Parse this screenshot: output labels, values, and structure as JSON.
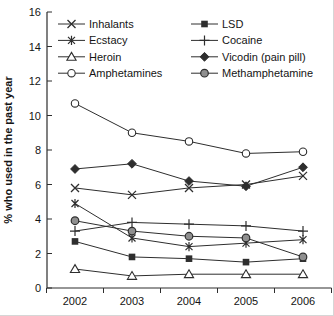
{
  "chart_data": {
    "type": "line",
    "title": "",
    "xlabel": "",
    "ylabel": "% who used in the past year",
    "categories": [
      "2002",
      "2003",
      "2004",
      "2005",
      "2006"
    ],
    "ylim": [
      0,
      16
    ],
    "yticks": [
      0,
      2,
      4,
      6,
      8,
      10,
      12,
      14,
      16
    ],
    "grid": false,
    "legend_position": "top-inside-two-columns-no-border",
    "line_color": "#2e2e2e",
    "marker_gray_fill": "#8f8f8f",
    "series": [
      {
        "name": "Inhalants",
        "marker": "x",
        "values": [
          5.8,
          5.4,
          5.8,
          6.0,
          6.5
        ]
      },
      {
        "name": "Ecstacy",
        "marker": "asterisk",
        "values": [
          4.9,
          2.9,
          2.4,
          2.6,
          2.8
        ]
      },
      {
        "name": "Heroin",
        "marker": "triangle-open",
        "values": [
          1.1,
          0.7,
          0.8,
          0.8,
          0.8
        ]
      },
      {
        "name": "Amphetamines",
        "marker": "circle-open",
        "values": [
          10.7,
          9.0,
          8.5,
          7.8,
          7.9
        ]
      },
      {
        "name": "LSD",
        "marker": "square-filled",
        "values": [
          2.7,
          1.8,
          1.7,
          1.5,
          1.7
        ]
      },
      {
        "name": "Cocaine",
        "marker": "plus",
        "values": [
          3.3,
          3.8,
          3.7,
          3.6,
          3.3
        ]
      },
      {
        "name": "Vicodin (pain pill)",
        "marker": "diamond-filled",
        "values": [
          6.9,
          7.2,
          6.2,
          5.9,
          7.0
        ]
      },
      {
        "name": "Methamphetamine",
        "marker": "circle-gray",
        "values": [
          3.9,
          3.3,
          3.0,
          2.9,
          1.8
        ]
      }
    ],
    "legend_columns": [
      [
        "Inhalants",
        "Ecstacy",
        "Heroin",
        "Amphetamines"
      ],
      [
        "LSD",
        "Cocaine",
        "Vicodin (pain pill)",
        "Methamphetamine"
      ]
    ]
  }
}
